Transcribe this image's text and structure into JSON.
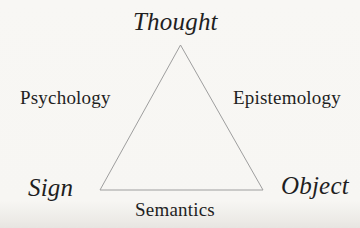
{
  "diagram": {
    "type": "triangle",
    "vertices": {
      "top": {
        "label": "Thought"
      },
      "bottom_left": {
        "label": "Sign"
      },
      "bottom_right": {
        "label": "Object"
      }
    },
    "edges": {
      "left": {
        "label": "Psychology"
      },
      "right": {
        "label": "Epistemology"
      },
      "bottom": {
        "label": "Semantics"
      }
    },
    "colors": {
      "background": "#f7f6f3",
      "line": "#9e9e9e",
      "text": "#1f1f1f"
    }
  }
}
